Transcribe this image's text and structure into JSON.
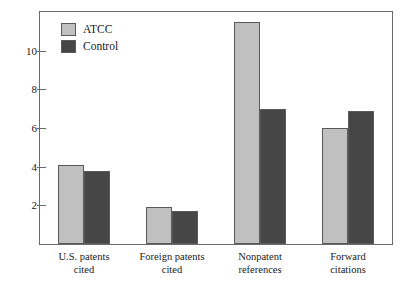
{
  "chart_data": {
    "type": "bar",
    "title": "",
    "subtitle": "",
    "xlabel": "",
    "ylabel": "",
    "ylim": [
      0,
      12
    ],
    "yticks": [
      2,
      4,
      6,
      8,
      10
    ],
    "ytick_labels": [
      "2",
      "4",
      "6",
      "8",
      "10"
    ],
    "grid": false,
    "legend_position": "top-left-inside",
    "categories": [
      "U.S. patents cited",
      "Foreign patents cited",
      "Nonpatent references",
      "Forward citations"
    ],
    "category_lines": [
      [
        "U.S. patents",
        "cited"
      ],
      [
        "Foreign patents",
        "cited"
      ],
      [
        "Nonpatent",
        "references"
      ],
      [
        "Forward",
        "citations"
      ]
    ],
    "series": [
      {
        "name": "ATCC",
        "color": "#c0c0c0",
        "values": [
          4.1,
          1.9,
          11.5,
          6.0
        ]
      },
      {
        "name": "Control",
        "color": "#464646",
        "values": [
          3.8,
          1.7,
          7.0,
          6.9
        ]
      }
    ]
  },
  "legend": {
    "items": [
      {
        "label": "ATCC",
        "color": "#c0c0c0"
      },
      {
        "label": "Control",
        "color": "#464646"
      }
    ]
  },
  "axis": {
    "tick_labels": [
      "10",
      "8",
      "6",
      "4",
      "2"
    ]
  },
  "colors": {
    "series_atcc": "#c0c0c0",
    "series_control": "#464646",
    "frame": "#6b6b6b",
    "bar_outline": "#5a5a5a",
    "text": "#1a1a1a",
    "background": "#ffffff"
  }
}
